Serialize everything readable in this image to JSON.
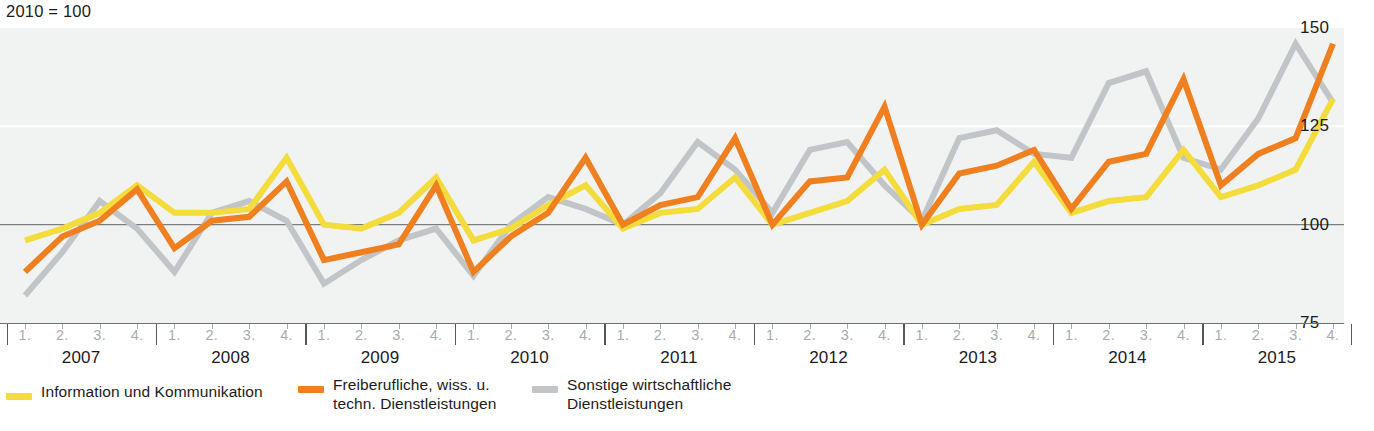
{
  "index_note": "2010 = 100",
  "colors": {
    "yellow": "#f3dc3c",
    "orange": "#f0801f",
    "gray": "#c2c5c7",
    "plot_bg": "#f1f3f3",
    "axis": "#6e7073",
    "gridline_100": "#7b7e81",
    "gridline_faint": "#fbfcfc",
    "quarter_label": "#a8abad"
  },
  "y_axis": {
    "ticks": [
      {
        "label": "150",
        "value": 150
      },
      {
        "label": "125",
        "value": 125
      },
      {
        "label": "100",
        "value": 100
      },
      {
        "label": "75",
        "value": 75
      }
    ]
  },
  "x_axis": {
    "years": [
      "2007",
      "2008",
      "2009",
      "2010",
      "2011",
      "2012",
      "2013",
      "2014",
      "2015"
    ],
    "quarter_labels": [
      "1.",
      "2.",
      "3.",
      "4."
    ]
  },
  "legend": [
    {
      "label": "Information und Kommunikation",
      "color": "#f3dc3c"
    },
    {
      "label": "Freiberufliche, wiss. u.\ntechn. Dienstleistungen",
      "color": "#f0801f"
    },
    {
      "label": "Sonstige wirtschaftliche\nDienstleistungen",
      "color": "#c2c5c7"
    }
  ],
  "chart_data": {
    "type": "line",
    "title": "",
    "subtitle": "2010 = 100",
    "xlabel": "",
    "ylabel": "",
    "ylim": [
      75,
      150
    ],
    "grid": true,
    "legend_position": "bottom",
    "categories": [
      "2007 1.",
      "2007 2.",
      "2007 3.",
      "2007 4.",
      "2008 1.",
      "2008 2.",
      "2008 3.",
      "2008 4.",
      "2009 1.",
      "2009 2.",
      "2009 3.",
      "2009 4.",
      "2010 1.",
      "2010 2.",
      "2010 3.",
      "2010 4.",
      "2011 1.",
      "2011 2.",
      "2011 3.",
      "2011 4.",
      "2012 1.",
      "2012 2.",
      "2012 3.",
      "2012 4.",
      "2013 1.",
      "2013 2.",
      "2013 3.",
      "2013 4.",
      "2014 1.",
      "2014 2.",
      "2014 3.",
      "2014 4.",
      "2015 1.",
      "2015 2.",
      "2015 3.",
      "2015 4."
    ],
    "series": [
      {
        "name": "Information und Kommunikation",
        "color": "#f3dc3c",
        "values": [
          96,
          99,
          103,
          110,
          103,
          103,
          104,
          117,
          100,
          99,
          103,
          112,
          96,
          99,
          105,
          110,
          99,
          103,
          104,
          112,
          100,
          103,
          106,
          114,
          100,
          104,
          105,
          116,
          103,
          106,
          107,
          119,
          107,
          110,
          114,
          132
        ]
      },
      {
        "name": "Freiberufliche, wiss. u. techn. Dienstleistungen",
        "color": "#f0801f",
        "values": [
          88,
          97,
          101,
          109,
          94,
          101,
          102,
          111,
          91,
          93,
          95,
          110,
          88,
          97,
          103,
          117,
          100,
          105,
          107,
          122,
          100,
          111,
          112,
          130,
          100,
          113,
          115,
          119,
          104,
          116,
          118,
          137,
          110,
          118,
          122,
          146
        ]
      },
      {
        "name": "Sonstige wirtschaftliche Dienstleistungen",
        "color": "#c2c5c7",
        "values": [
          82,
          93,
          106,
          99,
          88,
          103,
          106,
          101,
          85,
          91,
          96,
          99,
          87,
          100,
          107,
          104,
          100,
          108,
          121,
          114,
          103,
          119,
          121,
          110,
          101,
          122,
          124,
          118,
          117,
          136,
          139,
          117,
          114,
          127,
          146,
          131
        ]
      }
    ]
  }
}
